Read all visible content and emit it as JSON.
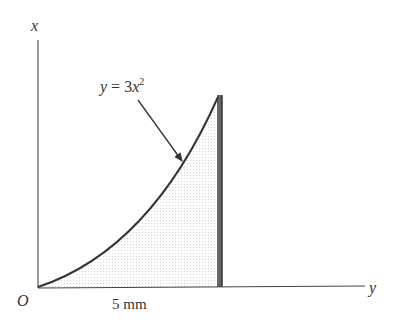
{
  "diagram": {
    "axis_labels": {
      "vertical": "x",
      "horizontal": "y",
      "origin": "O"
    },
    "curve_equation": {
      "lhs": "y",
      "eq": " = 3",
      "var": "x",
      "exp": "2"
    },
    "dimension_label": "5 mm",
    "colors": {
      "ink": "#333333",
      "shade": "#d9d9d9",
      "edge": "#555555"
    }
  }
}
